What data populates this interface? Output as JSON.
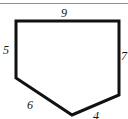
{
  "figure": {
    "shape_name": "hexagon",
    "stroke_color": "#111111",
    "fill_color": "#ffffff",
    "stroke_width": 3,
    "rule_color": "#8e8e8e",
    "vertices": [
      [
        16,
        21
      ],
      [
        119,
        21
      ],
      [
        119,
        95
      ],
      [
        72,
        115
      ],
      [
        16,
        78
      ]
    ],
    "labels": {
      "top": "9",
      "left": "5",
      "right": "7",
      "lower_left": "6",
      "lower_right": "4"
    }
  }
}
